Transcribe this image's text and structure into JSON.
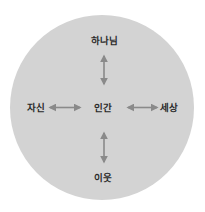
{
  "diagram": {
    "type": "relationship-circle",
    "background_color": "#d3d3d3",
    "arrow_color": "#8a8a8a",
    "text_color": "#2a2a2a",
    "center": {
      "label": "인간"
    },
    "nodes": {
      "top": {
        "label": "하나님"
      },
      "left": {
        "label": "자신"
      },
      "right": {
        "label": "세상"
      },
      "bottom": {
        "label": "이웃"
      }
    },
    "arrows": [
      {
        "from": "인간",
        "to": "하나님",
        "direction": "bidirectional"
      },
      {
        "from": "인간",
        "to": "자신",
        "direction": "bidirectional"
      },
      {
        "from": "인간",
        "to": "세상",
        "direction": "bidirectional"
      },
      {
        "from": "인간",
        "to": "이웃",
        "direction": "bidirectional"
      }
    ]
  }
}
